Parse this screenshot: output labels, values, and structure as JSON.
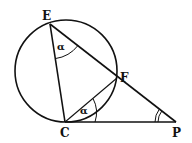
{
  "diagram": {
    "type": "geometry",
    "points": {
      "E": {
        "label": "E",
        "x": 50,
        "y": 24
      },
      "F": {
        "label": "F",
        "x": 117,
        "y": 78
      },
      "C": {
        "label": "C",
        "x": 65,
        "y": 122
      },
      "P": {
        "label": "P",
        "x": 176,
        "y": 122
      }
    },
    "circle": {
      "cx": 66,
      "cy": 71,
      "r": 51
    },
    "segments": [
      "EC",
      "EP",
      "CF",
      "CP"
    ],
    "angles": [
      {
        "vertex": "E",
        "label": "α",
        "marks": 1
      },
      {
        "vertex": "C",
        "between": "CF-CP",
        "label": "α",
        "marks": 1
      },
      {
        "vertex": "P",
        "label": "",
        "marks": 2
      }
    ]
  }
}
